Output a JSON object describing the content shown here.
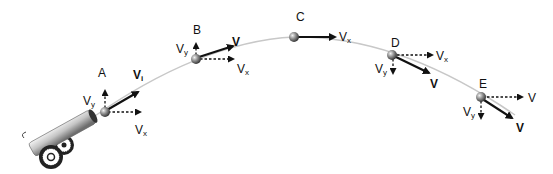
{
  "colors": {
    "trajectory": "#c8c8c8",
    "vector": "#111111",
    "ball": "#8a8a8a",
    "cannon_barrel": "#bdbdbd"
  },
  "points": [
    {
      "id": "A",
      "label": "A",
      "vy": {
        "base": "V",
        "sub": "y"
      },
      "vx": {
        "base": "V",
        "sub": "x"
      },
      "v": {
        "base": "V",
        "sub": "i"
      }
    },
    {
      "id": "B",
      "label": "B",
      "vy": {
        "base": "V",
        "sub": "y"
      },
      "vx": {
        "base": "V",
        "sub": "x"
      },
      "v": {
        "base": "V",
        "sub": ""
      }
    },
    {
      "id": "C",
      "label": "C",
      "vx": {
        "base": "V",
        "sub": "x"
      }
    },
    {
      "id": "D",
      "label": "D",
      "vy": {
        "base": "V",
        "sub": "y"
      },
      "vx": {
        "base": "V",
        "sub": "x"
      },
      "v": {
        "base": "V",
        "sub": ""
      }
    },
    {
      "id": "E",
      "label": "E",
      "vy": {
        "base": "V",
        "sub": "y"
      },
      "vx": {
        "base": "V",
        "sub": ""
      },
      "v": {
        "base": "V",
        "sub": ""
      }
    }
  ],
  "objects": {
    "launcher": "cannon-icon",
    "projectile": "ball-icon"
  }
}
